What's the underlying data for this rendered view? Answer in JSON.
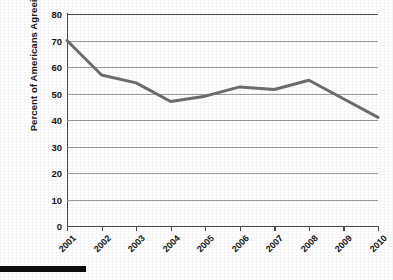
{
  "chart_data": {
    "type": "line",
    "title": "",
    "xlabel": "",
    "ylabel": "Percent of Americans Agreeing",
    "categories": [
      "2001",
      "2002",
      "2003",
      "2004",
      "2005",
      "2006",
      "2007",
      "2008",
      "2009",
      "2010"
    ],
    "values": [
      70,
      57,
      54,
      47,
      49,
      52.5,
      51.5,
      55,
      48,
      41
    ],
    "ylim": [
      0,
      80
    ],
    "ytick_values": [
      0,
      10,
      20,
      30,
      40,
      50,
      60,
      70,
      80
    ],
    "ytick_labels": [
      "0",
      "10",
      "20",
      "30",
      "40",
      "50",
      "60",
      "70",
      "80"
    ],
    "grid": true,
    "legend": null,
    "series_color": "#6e6e6e",
    "axis_color": "#4a4a4a",
    "grid_color": "#9b9b9b",
    "markers": false,
    "line_width": 3,
    "xtick_label_rotation": -45
  },
  "artifacts": {
    "scan_bar_label": "black-scan-bar"
  }
}
